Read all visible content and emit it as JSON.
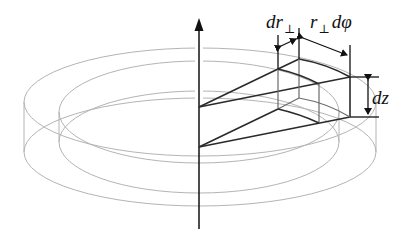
{
  "diagram": {
    "labels": {
      "dr_main": "dr",
      "dr_sub": "⊥",
      "rdphi_r": "r",
      "rdphi_sub": "⊥",
      "rdphi_rest": "dφ",
      "dz": "dz"
    },
    "colors": {
      "ring": "#b4b4b4",
      "wedge": "#2a2a2a",
      "dimension": "#111111"
    }
  }
}
